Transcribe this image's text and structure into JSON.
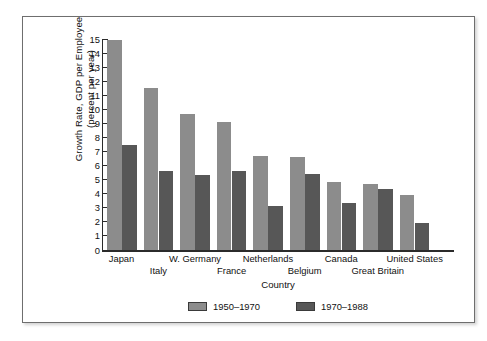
{
  "chart_data": {
    "type": "bar",
    "title": "",
    "xlabel": "Country",
    "ylabel": "Growth Rate, GDP per Employee (percent per year)",
    "ylabel_line1": "Growth Rate, GDP per Employee",
    "ylabel_line2": "(percent per year)",
    "ylim": [
      0,
      15
    ],
    "ytick_labels": [
      "15",
      "14",
      "13",
      "12",
      "11",
      "10",
      "9",
      "8",
      "7",
      "6",
      "5",
      "4",
      "3",
      "2",
      "1",
      "0"
    ],
    "ytick_values": [
      15,
      14,
      13,
      12,
      11,
      10,
      9,
      8,
      7,
      6,
      5,
      4,
      3,
      2,
      1,
      0
    ],
    "grid": false,
    "legend_position": "bottom-center",
    "categories": [
      "Japan",
      "Italy",
      "W. Germany",
      "France",
      "Netherlands",
      "Belgium",
      "Canada",
      "Great Britain",
      "United States"
    ],
    "category_label_rows": [
      0,
      1,
      0,
      1,
      0,
      1,
      0,
      1,
      0
    ],
    "series": [
      {
        "name": "1950-1970",
        "color": "#8c8c8c",
        "values": [
          14.9,
          11.5,
          9.7,
          9.1,
          6.7,
          6.6,
          4.8,
          4.7,
          3.9
        ]
      },
      {
        "name": "1970-1988",
        "color": "#575757",
        "values": [
          7.5,
          5.6,
          5.3,
          5.6,
          3.1,
          5.4,
          3.35,
          4.35,
          1.9
        ]
      }
    ]
  }
}
